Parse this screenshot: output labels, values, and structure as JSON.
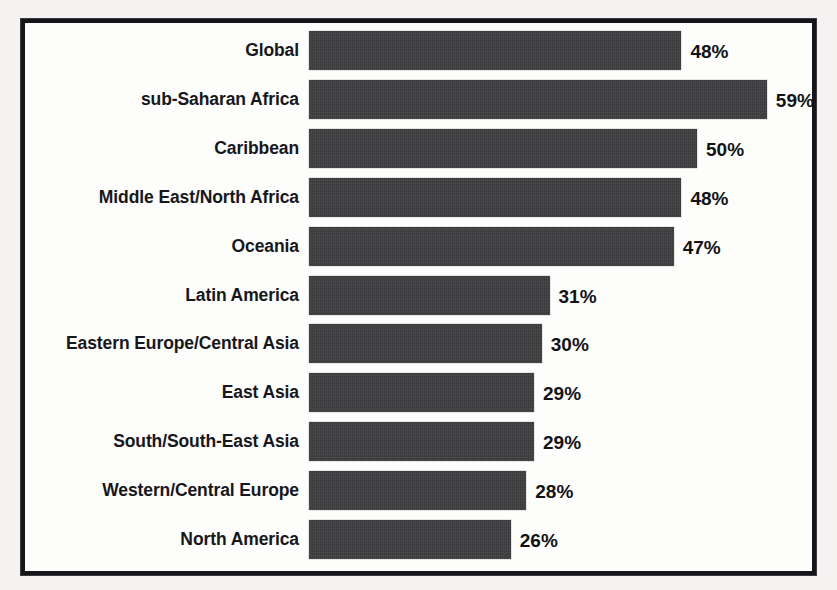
{
  "chart_data": {
    "type": "bar",
    "orientation": "horizontal",
    "title": "",
    "subtitle": "",
    "xlabel": "",
    "ylabel": "",
    "xlim": [
      0,
      63
    ],
    "grid": false,
    "legend": null,
    "bar_color": "#3a3a3c",
    "frame_color": "#16161a",
    "background": "#fdfdfb",
    "value_suffix": "%",
    "categories": [
      "Global",
      "sub-Saharan Africa",
      "Caribbean",
      "Middle East/North Africa",
      "Oceania",
      "Latin America",
      "Eastern Europe/Central Asia",
      "East Asia",
      "South/South-East Asia",
      "Western/Central Europe",
      "North America"
    ],
    "values": [
      48,
      59,
      50,
      48,
      47,
      31,
      30,
      29,
      29,
      28,
      26
    ],
    "data_labels": [
      "48%",
      "59%",
      "50%",
      "48%",
      "47%",
      "31%",
      "30%",
      "29%",
      "29%",
      "28%",
      "26%"
    ]
  }
}
